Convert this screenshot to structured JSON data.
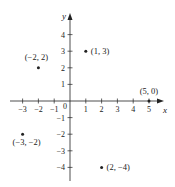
{
  "chart_data": {
    "type": "scatter",
    "title": "",
    "xlabel": "x",
    "ylabel": "y",
    "xlim": [
      -3.5,
      5.5
    ],
    "ylim": [
      -5,
      5
    ],
    "x_ticks": [
      -3,
      -2,
      -1,
      1,
      2,
      3,
      4,
      5
    ],
    "y_ticks": [
      -4,
      -3,
      -2,
      -1,
      1,
      2,
      3,
      4
    ],
    "origin_label": "0",
    "grid": false,
    "points": [
      {
        "x": 1,
        "y": 3,
        "label": "(1, 3)"
      },
      {
        "x": -2,
        "y": 2,
        "label": "(−2, 2)"
      },
      {
        "x": 5,
        "y": 0,
        "label": "(5, 0)"
      },
      {
        "x": -3,
        "y": -2,
        "label": "(−3, −2)"
      },
      {
        "x": 2,
        "y": -4,
        "label": "(2, −4)"
      }
    ]
  },
  "colors": {
    "ink": "#222222",
    "background": "#ffffff"
  }
}
